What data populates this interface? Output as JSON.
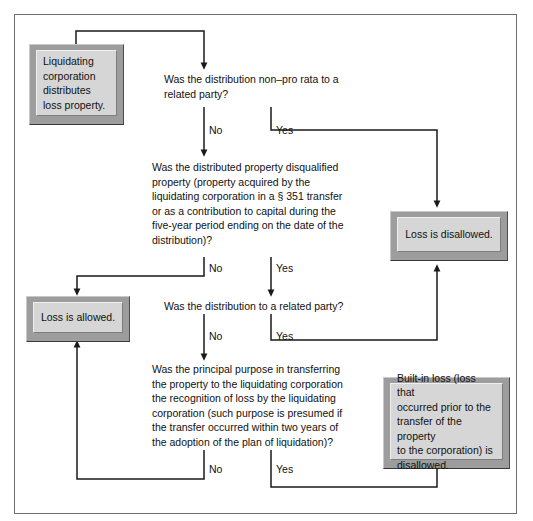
{
  "diagram": {
    "frame_border_color": "#6d6d6d",
    "box_face_color": "#d6d6d6",
    "box_bevel_color": "#9d9d9d",
    "wire_color": "#1a1a1a"
  },
  "nodes": {
    "start": {
      "id": "start",
      "kind": "terminal",
      "text": "Liquidating\ncorporation\ndistributes\nloss property."
    },
    "q1": {
      "id": "q1",
      "kind": "decision",
      "text": "Was the distribution non–pro rata to a\nrelated party?"
    },
    "q2": {
      "id": "q2",
      "kind": "decision",
      "text": "Was the distributed property disqualified\nproperty (property acquired by the\nliquidating corporation in a § 351 transfer\nor as a contribution to capital during the\nfive-year period ending on the date of the\ndistribution)?"
    },
    "q3": {
      "id": "q3",
      "kind": "decision",
      "text": "Was the distribution to a related party?"
    },
    "q4": {
      "id": "q4",
      "kind": "decision",
      "text": "Was the principal purpose in transferring\nthe property to the liquidating corporation\nthe recognition of loss by the liquidating\ncorporation (such purpose is presumed if\nthe transfer occurred within two years of\nthe adoption of the plan of liquidation)?"
    },
    "disallowed": {
      "id": "disallowed",
      "kind": "terminal",
      "text": "Loss is disallowed."
    },
    "allowed": {
      "id": "allowed",
      "kind": "terminal",
      "text": "Loss is allowed."
    },
    "builtin": {
      "id": "builtin",
      "kind": "terminal",
      "text": "Built-in loss (loss that\noccurred prior to the\ntransfer of the property\nto the corporation) is\ndisallowed."
    }
  },
  "branch_labels": {
    "q1_no": "No",
    "q1_yes": "Yes",
    "q2_no": "No",
    "q2_yes": "Yes",
    "q3_no": "No",
    "q3_yes": "Yes",
    "q4_no": "No",
    "q4_yes": "Yes"
  }
}
